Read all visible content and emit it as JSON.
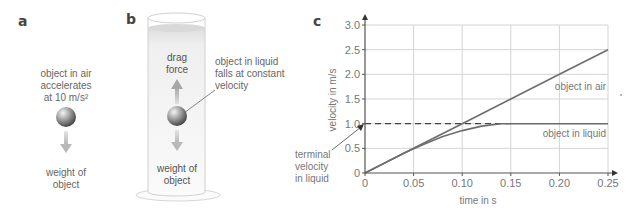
{
  "panels": {
    "a": {
      "letter": "a",
      "caption_lines": [
        "object in air",
        "accelerates",
        "at 10 m/s²"
      ],
      "weight_label_lines": [
        "weight of",
        "object"
      ]
    },
    "b": {
      "letter": "b",
      "drag_label_lines": [
        "drag",
        "force"
      ],
      "callout_lines": [
        "object in liquid",
        "falls at constant",
        "velocity"
      ],
      "weight_label_lines": [
        "weight of",
        "object"
      ]
    },
    "c": {
      "letter": "c"
    }
  },
  "colors": {
    "line": "#6d6d6d",
    "grid": "#d4d4d4",
    "axis": "#555555",
    "arrow_fill": "#bdbdbd",
    "liquid_fill": "#e8e8e8"
  },
  "chart_data": {
    "type": "line",
    "title": "",
    "xlabel": "time in s",
    "ylabel": "velocity in m/s",
    "xlim": [
      0,
      0.25
    ],
    "ylim": [
      0,
      3.0
    ],
    "xticks": [
      0,
      0.05,
      0.1,
      0.15,
      0.2,
      0.25
    ],
    "xtick_labels": [
      "0",
      "0.05",
      "0.10",
      "0.15",
      "0.20",
      "0.25"
    ],
    "yticks": [
      0,
      0.5,
      1.0,
      1.5,
      2.0,
      2.5,
      3.0
    ],
    "ytick_labels": [
      "0",
      "0.5",
      "1.0",
      "1.5",
      "2.0",
      "2.5",
      "3.0"
    ],
    "grid": true,
    "series": [
      {
        "name": "object in air",
        "x": [
          0,
          0.05,
          0.1,
          0.15,
          0.2,
          0.25
        ],
        "y": [
          0,
          0.5,
          1.0,
          1.5,
          2.0,
          2.5
        ]
      },
      {
        "name": "object in liquid",
        "x": [
          0,
          0.02,
          0.04,
          0.05,
          0.06,
          0.08,
          0.1,
          0.12,
          0.14,
          0.15,
          0.2,
          0.25
        ],
        "y": [
          0,
          0.2,
          0.4,
          0.49,
          0.58,
          0.74,
          0.86,
          0.95,
          1.0,
          1.0,
          1.0,
          1.0
        ]
      }
    ],
    "reference_lines": [
      {
        "type": "horizontal-dashed",
        "y": 1.0,
        "x_range": [
          0,
          0.15
        ]
      }
    ],
    "annotations": [
      {
        "text_lines": [
          "terminal",
          "velocity",
          "in liquid"
        ],
        "points_to": {
          "x": 0,
          "y": 1.0
        }
      },
      {
        "text": "object in air",
        "near_series": "object in air"
      },
      {
        "text": "object in liquid",
        "near_series": "object in liquid"
      }
    ]
  }
}
